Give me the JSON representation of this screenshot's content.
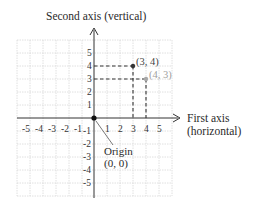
{
  "diagram": {
    "y_axis_label": "Second axis (vertical)",
    "x_axis_label_line1": "First axis",
    "x_axis_label_line2": "(horizontal)",
    "origin_label_line1": "Origin",
    "origin_label_line2": "(0, 0)",
    "x_ticks": [
      "-5",
      "-4",
      "-3",
      "-2",
      "-1",
      "1",
      "2",
      "3",
      "4",
      "5"
    ],
    "y_ticks": [
      "5",
      "4",
      "3",
      "2",
      "1",
      "-1",
      "-2",
      "-3",
      "-4",
      "-5"
    ],
    "points": [
      {
        "label": "(3, 4)",
        "x": 3,
        "y": 4,
        "color": "#333333"
      },
      {
        "label": "(4, 3)",
        "x": 4,
        "y": 3,
        "color": "#a8a8a8"
      }
    ],
    "colors": {
      "grid": "#d8d8d8",
      "axis": "#333333",
      "dashed": "#333333"
    }
  }
}
